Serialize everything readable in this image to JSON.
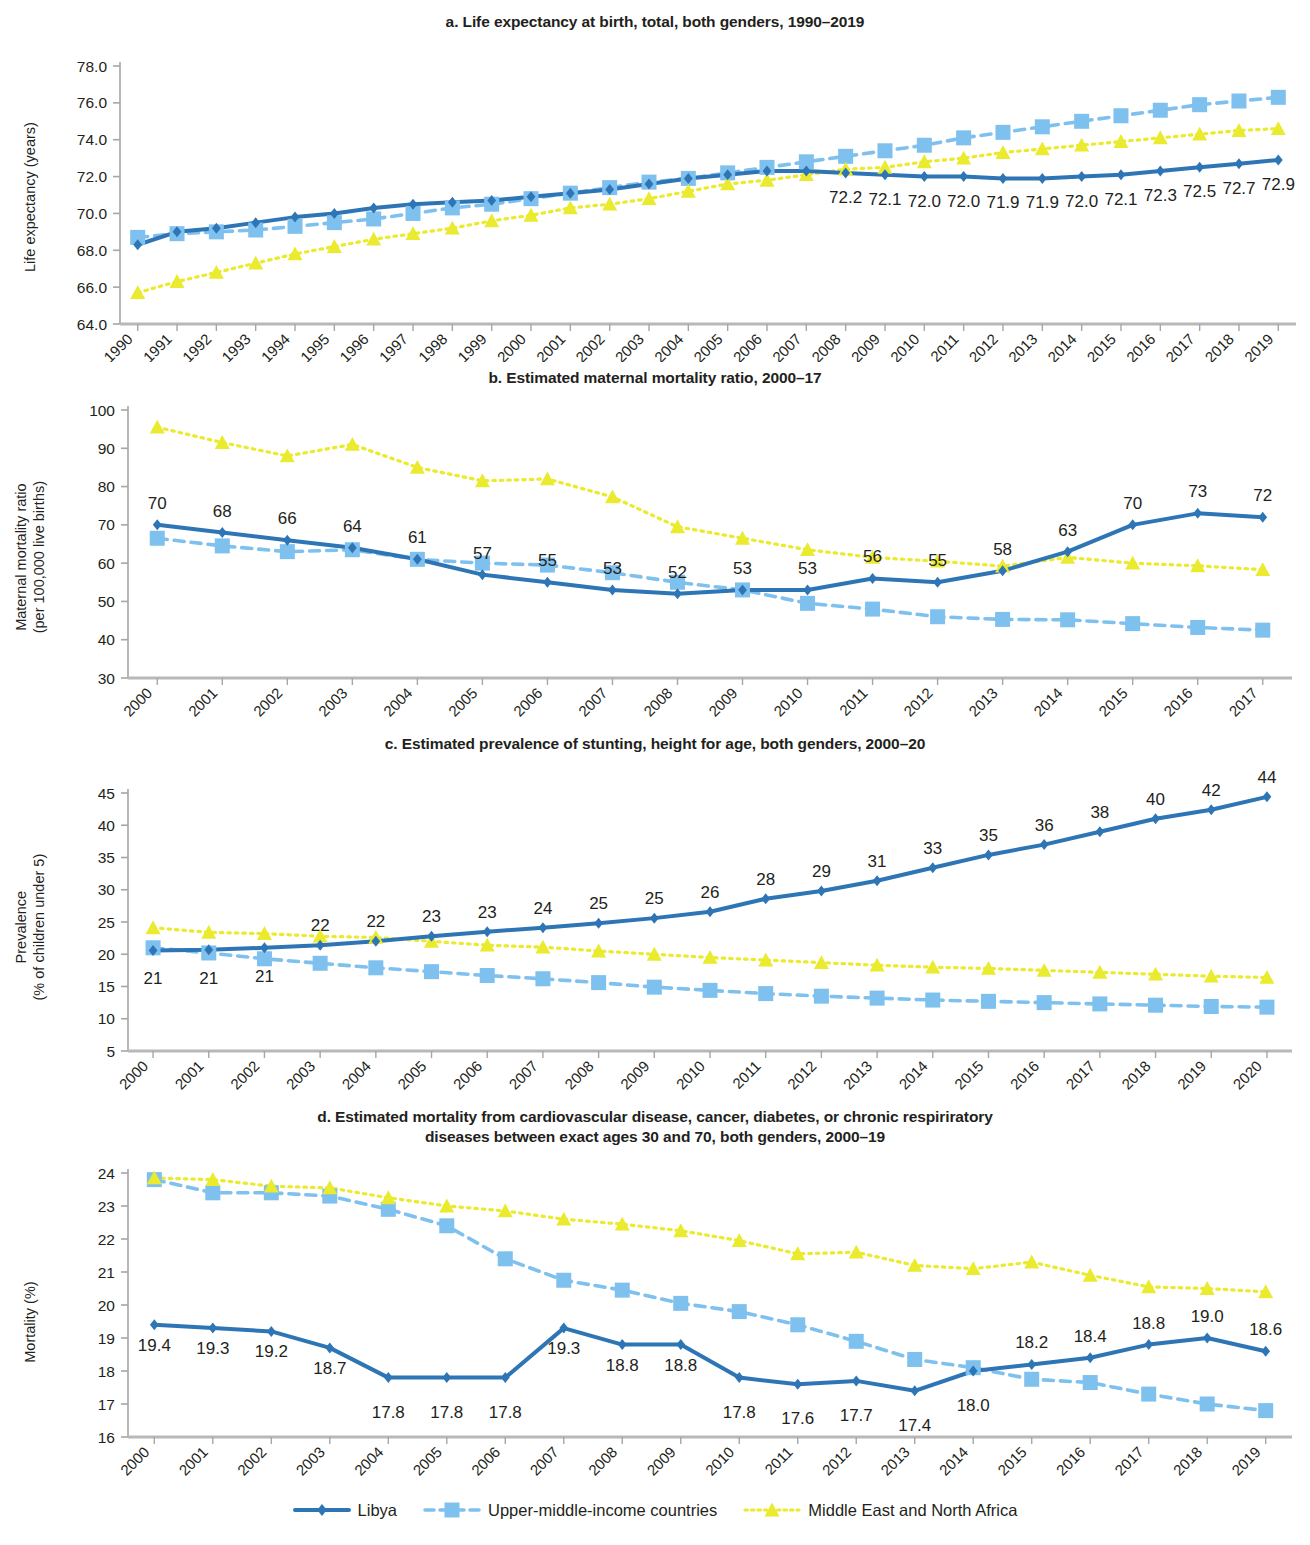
{
  "figure": {
    "series_names": {
      "libya": "Libya",
      "umic": "Upper-middle-income countries",
      "mena": "Middle East and North Africa"
    },
    "colors": {
      "libya": "#2E75B6",
      "umic": "#7EC0EE",
      "mena": "#EAEA2E",
      "axis": "#a6a6a6",
      "text": "#231f20"
    }
  },
  "legend": {
    "items": [
      {
        "label": "Libya",
        "marker": "diamond-marker",
        "color": "#2E75B6",
        "style": "solid"
      },
      {
        "label": "Upper-middle-income countries",
        "marker": "square-marker",
        "color": "#7EC0EE",
        "style": "dashed"
      },
      {
        "label": "Middle East and North Africa",
        "marker": "triangle-marker",
        "color": "#EAEA2E",
        "style": "dotted"
      }
    ]
  },
  "chart_data": [
    {
      "id": "panel-a",
      "type": "line",
      "title": "a. Life expectancy at birth, total, both genders, 1990–2019",
      "xlabel": "",
      "ylabel": "Life expectancy (years)",
      "ylim": [
        64.0,
        78.0
      ],
      "yticks": [
        "64.0",
        "66.0",
        "68.0",
        "70.0",
        "72.0",
        "74.0",
        "76.0",
        "78.0"
      ],
      "ytick_values": [
        64,
        66,
        68,
        70,
        72,
        74,
        76,
        78
      ],
      "grid": false,
      "legend_position": "bottom-figure",
      "categories": [
        "1990",
        "1991",
        "1992",
        "1993",
        "1994",
        "1995",
        "1996",
        "1997",
        "1998",
        "1999",
        "2000",
        "2001",
        "2002",
        "2003",
        "2004",
        "2005",
        "2006",
        "2007",
        "2008",
        "2009",
        "2010",
        "2011",
        "2012",
        "2013",
        "2014",
        "2015",
        "2016",
        "2017",
        "2018",
        "2019"
      ],
      "series": [
        {
          "name": "Libya",
          "values": [
            68.3,
            69.0,
            69.2,
            69.5,
            69.8,
            70.0,
            70.3,
            70.5,
            70.6,
            70.7,
            70.9,
            71.1,
            71.3,
            71.6,
            71.9,
            72.1,
            72.3,
            72.3,
            72.2,
            72.1,
            72.0,
            72.0,
            71.9,
            71.9,
            72.0,
            72.1,
            72.3,
            72.5,
            72.7,
            72.9
          ]
        },
        {
          "name": "Upper-middle-income countries",
          "values": [
            68.7,
            68.9,
            69.0,
            69.1,
            69.3,
            69.5,
            69.7,
            70.0,
            70.3,
            70.5,
            70.8,
            71.1,
            71.4,
            71.7,
            71.9,
            72.2,
            72.5,
            72.8,
            73.1,
            73.4,
            73.7,
            74.1,
            74.4,
            74.7,
            75.0,
            75.3,
            75.6,
            75.9,
            76.1,
            76.3
          ]
        },
        {
          "name": "Middle East and North Africa",
          "values": [
            65.7,
            66.3,
            66.8,
            67.3,
            67.8,
            68.2,
            68.6,
            68.9,
            69.2,
            69.6,
            69.9,
            70.3,
            70.5,
            70.8,
            71.2,
            71.6,
            71.8,
            72.1,
            72.4,
            72.5,
            72.8,
            73.0,
            73.3,
            73.5,
            73.7,
            73.9,
            74.1,
            74.3,
            74.5,
            74.6
          ]
        }
      ],
      "data_labels": {
        "series": "Libya",
        "start_category": "2008",
        "values": [
          "72.2",
          "72.1",
          "72.0",
          "72.0",
          "71.9",
          "71.9",
          "72.0",
          "72.1",
          "72.3",
          "72.5",
          "72.7",
          "72.9"
        ]
      }
    },
    {
      "id": "panel-b",
      "type": "line",
      "title": "b. Estimated maternal mortality ratio, 2000–17",
      "xlabel": "",
      "ylabel": "Maternal mortality ratio\n(per 100,000 live births)",
      "ylabel_lines": [
        "Maternal mortality ratio",
        "(per 100,000 live births)"
      ],
      "ylim": [
        30,
        100
      ],
      "yticks": [
        "30",
        "40",
        "50",
        "60",
        "70",
        "80",
        "90",
        "100"
      ],
      "ytick_values": [
        30,
        40,
        50,
        60,
        70,
        80,
        90,
        100
      ],
      "grid": false,
      "categories": [
        "2000",
        "2001",
        "2002",
        "2003",
        "2004",
        "2005",
        "2006",
        "2007",
        "2008",
        "2009",
        "2010",
        "2011",
        "2012",
        "2013",
        "2014",
        "2015",
        "2016",
        "2017"
      ],
      "series": [
        {
          "name": "Libya",
          "values": [
            70,
            68,
            66,
            64,
            61,
            57,
            55,
            53,
            52,
            53,
            53,
            56,
            55,
            58,
            63,
            70,
            73,
            72
          ]
        },
        {
          "name": "Upper-middle-income countries",
          "values": [
            66.5,
            64.5,
            63,
            63.5,
            61,
            60,
            59.5,
            57.5,
            55,
            53,
            49.5,
            48,
            46,
            45.3,
            45.2,
            44.2,
            43.2,
            42.5
          ]
        },
        {
          "name": "Middle East and North Africa",
          "values": [
            95.5,
            91.5,
            88,
            91,
            85,
            81.5,
            82,
            77.3,
            69.5,
            66.5,
            63.5,
            61.5,
            60.5,
            59.2,
            61.5,
            60,
            59.3,
            58.3
          ]
        }
      ],
      "data_labels": {
        "series": "Libya",
        "values": [
          "70",
          "68",
          "66",
          "64",
          "61",
          "57",
          "55",
          "53",
          "52",
          "53",
          "53",
          "56",
          "55",
          "58",
          "63",
          "70",
          "73",
          "72"
        ]
      }
    },
    {
      "id": "panel-c",
      "type": "line",
      "title": "c. Estimated prevalence of stunting, height for age, both genders, 2000–20",
      "xlabel": "",
      "ylabel": "Prevalence\n(% of children under 5)",
      "ylabel_lines": [
        "Prevalence",
        "(% of children under 5)"
      ],
      "ylim": [
        5,
        45
      ],
      "yticks": [
        "5",
        "10",
        "15",
        "20",
        "25",
        "30",
        "35",
        "40",
        "45"
      ],
      "ytick_values": [
        5,
        10,
        15,
        20,
        25,
        30,
        35,
        40,
        45
      ],
      "grid": false,
      "categories": [
        "2000",
        "2001",
        "2002",
        "2003",
        "2004",
        "2005",
        "2006",
        "2007",
        "2008",
        "2009",
        "2010",
        "2011",
        "2012",
        "2013",
        "2014",
        "2015",
        "2016",
        "2017",
        "2018",
        "2019",
        "2020"
      ],
      "series": [
        {
          "name": "Libya",
          "values": [
            20.6,
            20.7,
            21.0,
            21.4,
            22.0,
            22.8,
            23.5,
            24.1,
            24.8,
            25.6,
            26.6,
            28.6,
            29.8,
            31.4,
            33.4,
            35.4,
            37.0,
            39.0,
            41.0,
            42.4,
            44.4
          ]
        },
        {
          "name": "Upper-middle-income countries",
          "values": [
            21.0,
            20.2,
            19.3,
            18.6,
            17.9,
            17.3,
            16.7,
            16.2,
            15.6,
            14.9,
            14.4,
            13.9,
            13.5,
            13.2,
            12.9,
            12.7,
            12.5,
            12.3,
            12.1,
            11.9,
            11.8
          ]
        },
        {
          "name": "Middle East and North Africa",
          "values": [
            24.1,
            23.4,
            23.2,
            22.8,
            22.6,
            22.0,
            21.4,
            21.1,
            20.5,
            20.0,
            19.5,
            19.1,
            18.7,
            18.3,
            18.0,
            17.8,
            17.5,
            17.2,
            16.9,
            16.6,
            16.4
          ]
        }
      ],
      "data_labels": {
        "series": "Libya",
        "values": [
          "21",
          "21",
          "21",
          "22",
          "22",
          "23",
          "23",
          "24",
          "25",
          "25",
          "26",
          "28",
          "29",
          "31",
          "33",
          "35",
          "36",
          "38",
          "40",
          "42",
          "44"
        ],
        "below_for": [
          "2000",
          "2001",
          "2002"
        ]
      }
    },
    {
      "id": "panel-d",
      "type": "line",
      "title": "d. Estimated mortality from cardiovascular disease, cancer, diabetes, or chronic respiriratory diseases between exact ages 30 and 70, both genders, 2000–19",
      "title_lines": [
        "d. Estimated mortality from cardiovascular disease, cancer, diabetes, or chronic respiriratory",
        "diseases between exact ages 30 and 70, both genders, 2000–19"
      ],
      "xlabel": "",
      "ylabel": "Mortality (%)",
      "ylim": [
        16,
        24
      ],
      "yticks": [
        "16",
        "17",
        "18",
        "19",
        "20",
        "21",
        "22",
        "23",
        "24"
      ],
      "ytick_values": [
        16,
        17,
        18,
        19,
        20,
        21,
        22,
        23,
        24
      ],
      "grid": false,
      "categories": [
        "2000",
        "2001",
        "2002",
        "2003",
        "2004",
        "2005",
        "2006",
        "2007",
        "2008",
        "2009",
        "2010",
        "2011",
        "2012",
        "2013",
        "2014",
        "2015",
        "2016",
        "2017",
        "2018",
        "2019"
      ],
      "series": [
        {
          "name": "Libya",
          "values": [
            19.4,
            19.3,
            19.2,
            18.7,
            17.8,
            17.8,
            17.8,
            19.3,
            18.8,
            18.8,
            17.8,
            17.6,
            17.7,
            17.4,
            18.0,
            18.2,
            18.4,
            18.8,
            19.0,
            18.6
          ]
        },
        {
          "name": "Upper-middle-income countries",
          "values": [
            23.8,
            23.4,
            23.4,
            23.3,
            22.9,
            22.4,
            21.4,
            20.75,
            20.45,
            20.05,
            19.8,
            19.4,
            18.9,
            18.35,
            18.1,
            17.75,
            17.65,
            17.3,
            17.0,
            16.8
          ]
        },
        {
          "name": "Middle East and North Africa",
          "values": [
            23.85,
            23.8,
            23.6,
            23.55,
            23.25,
            23.0,
            22.85,
            22.6,
            22.45,
            22.25,
            21.95,
            21.55,
            21.6,
            21.2,
            21.1,
            21.3,
            20.9,
            20.55,
            20.5,
            20.4
          ]
        }
      ],
      "data_labels": {
        "series": "Libya",
        "values": [
          "19.4",
          "19.3",
          "19.2",
          "18.7",
          "17.8",
          "17.8",
          "17.8",
          "19.3",
          "18.8",
          "18.8",
          "17.8",
          "17.6",
          "17.7",
          "17.4",
          "18.0",
          "18.2",
          "18.4",
          "18.8",
          "19.0",
          "18.6"
        ]
      }
    }
  ]
}
